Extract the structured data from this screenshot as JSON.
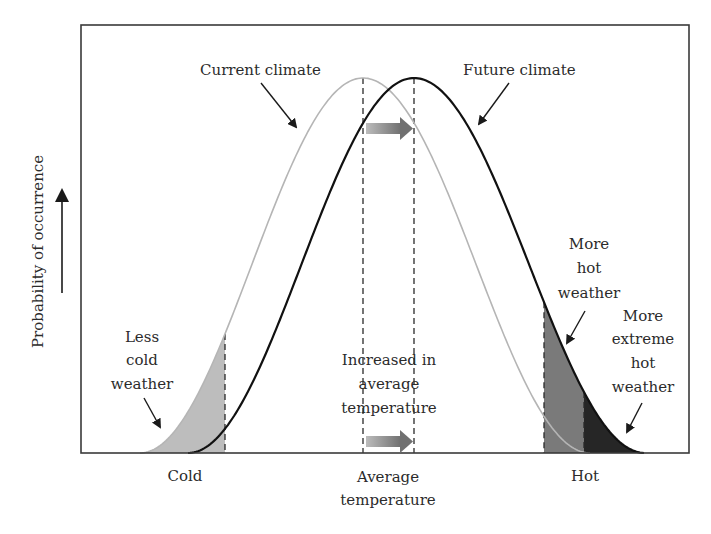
{
  "chart_data": {
    "type": "area",
    "title": "",
    "xlabel": "",
    "ylabel": "Probability of occurrence",
    "x_ticks": [
      {
        "label": "Cold",
        "x": 185
      },
      {
        "label": "Average temperature",
        "x": 388
      },
      {
        "label": "Hot",
        "x": 585
      }
    ],
    "grid": false,
    "series": [
      {
        "name": "Current climate",
        "color": "#b5b5b5",
        "mean_px": 363,
        "start_px": 140,
        "end_px": 590,
        "peak_y_px": 78
      },
      {
        "name": "Future climate",
        "color": "#111111",
        "mean_px": 414,
        "start_px": 188,
        "end_px": 645,
        "peak_y_px": 78
      }
    ],
    "shaded_regions": [
      {
        "name": "Less cold weather",
        "curve": "Current climate",
        "from_px": 140,
        "to_px": 225,
        "color": "#bdbdbd"
      },
      {
        "name": "More hot weather",
        "curve": "Future climate",
        "from_px": 544,
        "to_px": 584,
        "color": "#7a7a7a"
      },
      {
        "name": "More extreme hot weather",
        "curve": "Future climate",
        "from_px": 584,
        "to_px": 645,
        "color": "#262626"
      }
    ],
    "dashed_lines_px": [
      225,
      363,
      414,
      544,
      584
    ],
    "annotations": [
      "Current climate",
      "Future climate",
      "Less cold weather",
      "Increased in average temperature",
      "More hot weather",
      "More extreme hot weather"
    ]
  },
  "frame": {
    "left": 81,
    "top": 25,
    "right": 689,
    "bottom": 453
  },
  "labels": {
    "y_axis": "Probability of occurrence",
    "current_climate": "Current climate",
    "future_climate": "Future climate",
    "less_cold": [
      "Less",
      "cold",
      "weather"
    ],
    "increase": [
      "Increased in",
      "average",
      "temperature"
    ],
    "more_hot": [
      "More",
      "hot",
      "weather"
    ],
    "more_extreme": [
      "More",
      "extreme",
      "hot",
      "weather"
    ],
    "x_cold": "Cold",
    "x_avg": [
      "Average",
      "temperature"
    ],
    "x_hot": "Hot"
  }
}
